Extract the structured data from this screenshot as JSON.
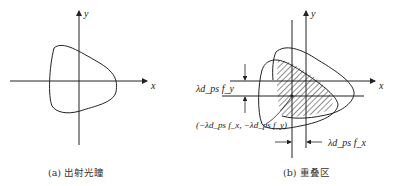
{
  "panel_a": {
    "caption": "(a) 出射光瞳",
    "axis_x": "x",
    "axis_y": "y"
  },
  "panel_b": {
    "caption": "(b) 重叠区",
    "axis_x": "x",
    "axis_y": "y",
    "label_vertical_offset": "λd_ps f_y",
    "label_horizontal_offset": "λd_ps f_x",
    "label_shift_point": "(−λd_ps f_x, −λd_ps f_y)"
  },
  "colors": {
    "line": "#222222",
    "background": "#ffffff"
  }
}
